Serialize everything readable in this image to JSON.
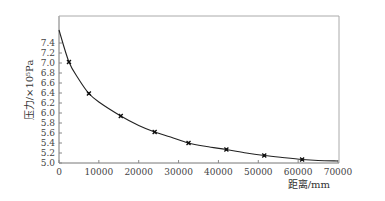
{
  "chart_data": {
    "type": "line",
    "title": "",
    "xlabel": "距离/mm",
    "ylabel": "压力/×10⁵Pa",
    "xlim": [
      0,
      70000
    ],
    "ylim": [
      5.0,
      7.6
    ],
    "x_ticks": [
      0,
      10000,
      20000,
      30000,
      40000,
      50000,
      60000,
      70000
    ],
    "x_tick_labels": [
      "0",
      "10000",
      "20000",
      "30000",
      "40000",
      "50000",
      "60000",
      "70000"
    ],
    "y_ticks": [
      5.0,
      5.2,
      5.4,
      5.6,
      5.8,
      6.0,
      6.2,
      6.4,
      6.6,
      6.8,
      7.0,
      7.2,
      7.4
    ],
    "y_tick_labels": [
      "5.0",
      "5.2",
      "5.4",
      "5.6",
      "5.8",
      "6.0",
      "6.2",
      "6.4",
      "6.6",
      "6.8",
      "7.0",
      "7.2",
      "7.4"
    ],
    "grid": false,
    "legend": null,
    "series": [
      {
        "name": "measured points",
        "style": "markers",
        "x": [
          2500,
          7500,
          15500,
          24000,
          32500,
          42000,
          51500,
          61000
        ],
        "y": [
          7.02,
          6.39,
          5.94,
          5.62,
          5.4,
          5.27,
          5.15,
          5.07
        ]
      },
      {
        "name": "fitted curve",
        "style": "line",
        "x": [
          0,
          2500,
          5000,
          7500,
          10000,
          15500,
          20000,
          24000,
          28000,
          32500,
          37000,
          42000,
          47000,
          51500,
          56000,
          61000,
          65000,
          70000
        ],
        "y": [
          7.66,
          7.02,
          6.67,
          6.39,
          6.22,
          5.94,
          5.75,
          5.62,
          5.52,
          5.4,
          5.33,
          5.27,
          5.2,
          5.15,
          5.11,
          5.07,
          5.05,
          5.04
        ]
      }
    ]
  }
}
